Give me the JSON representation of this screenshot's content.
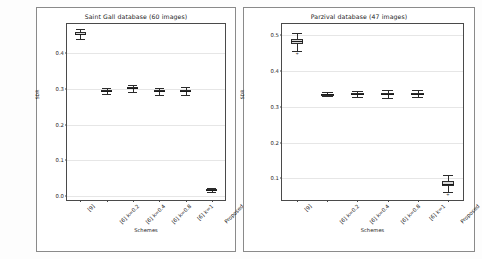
{
  "chart_data": [
    {
      "type": "box",
      "title": "Saint Gall database (60 images)",
      "xlabel": "Schemes",
      "ylabel": "SDR",
      "categories": [
        "[9]",
        "[6] k=0.2",
        "[6] k=0.4",
        "[6] k=0.8",
        "[6] k=1",
        "Proposed"
      ],
      "ylim": [
        -0.01,
        0.48
      ],
      "yticks": [
        "0.0",
        "0.1",
        "0.2",
        "0.3",
        "0.4"
      ],
      "ytick_values": [
        0.0,
        0.1,
        0.2,
        0.3,
        0.4
      ],
      "grid": true,
      "legend": "none",
      "boxes": [
        {
          "category": "[9]",
          "whisker_low": 0.437,
          "q1": 0.448,
          "median": 0.452,
          "q3": 0.457,
          "whisker_high": 0.466,
          "fliers": []
        },
        {
          "category": "[6] k=0.2",
          "whisker_low": 0.284,
          "q1": 0.291,
          "median": 0.293,
          "q3": 0.296,
          "whisker_high": 0.302,
          "fliers": []
        },
        {
          "category": "[6] k=0.4",
          "whisker_low": 0.292,
          "q1": 0.298,
          "median": 0.301,
          "q3": 0.304,
          "whisker_high": 0.311,
          "fliers": []
        },
        {
          "category": "[6] k=0.8",
          "whisker_low": 0.283,
          "q1": 0.291,
          "median": 0.293,
          "q3": 0.296,
          "whisker_high": 0.303,
          "fliers": []
        },
        {
          "category": "[6] k=1",
          "whisker_low": 0.283,
          "q1": 0.29,
          "median": 0.293,
          "q3": 0.296,
          "whisker_high": 0.304,
          "fliers": []
        },
        {
          "category": "Proposed",
          "whisker_low": 0.012,
          "q1": 0.016,
          "median": 0.018,
          "q3": 0.02,
          "whisker_high": 0.024,
          "fliers": []
        }
      ]
    },
    {
      "type": "box",
      "title": "Parzival database (47 images)",
      "xlabel": "Schemes",
      "ylabel": "SDR",
      "categories": [
        "[9]",
        "[6] k=0.2",
        "[6] k=0.4",
        "[6] k=0.8",
        "[6] k=1",
        "Proposed"
      ],
      "ylim": [
        0.04,
        0.53
      ],
      "yticks": [
        "0.1",
        "0.2",
        "0.3",
        "0.4",
        "0.5"
      ],
      "ytick_values": [
        0.1,
        0.2,
        0.3,
        0.4,
        0.5
      ],
      "grid": true,
      "legend": "none",
      "boxes": [
        {
          "category": "[9]",
          "whisker_low": 0.455,
          "q1": 0.474,
          "median": 0.482,
          "q3": 0.489,
          "whisker_high": 0.504,
          "fliers": [
            0.446
          ]
        },
        {
          "category": "[6] k=0.2",
          "whisker_low": 0.33,
          "q1": 0.333,
          "median": 0.334,
          "q3": 0.336,
          "whisker_high": 0.34,
          "fliers": []
        },
        {
          "category": "[6] k=0.4",
          "whisker_low": 0.328,
          "q1": 0.333,
          "median": 0.336,
          "q3": 0.338,
          "whisker_high": 0.344,
          "fliers": []
        },
        {
          "category": "[6] k=0.8",
          "whisker_low": 0.325,
          "q1": 0.332,
          "median": 0.335,
          "q3": 0.338,
          "whisker_high": 0.346,
          "fliers": []
        },
        {
          "category": "[6] k=1",
          "whisker_low": 0.326,
          "q1": 0.332,
          "median": 0.336,
          "q3": 0.339,
          "whisker_high": 0.347,
          "fliers": []
        },
        {
          "category": "Proposed",
          "whisker_low": 0.063,
          "q1": 0.079,
          "median": 0.085,
          "q3": 0.092,
          "whisker_high": 0.11,
          "fliers": [
            0.055
          ]
        }
      ]
    }
  ]
}
